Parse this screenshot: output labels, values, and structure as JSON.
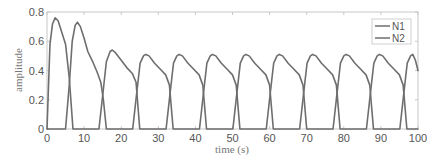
{
  "chart_data": {
    "type": "line",
    "title": "",
    "xlabel": "time (s)",
    "ylabel": "amplitude",
    "xlim": [
      0,
      100
    ],
    "ylim": [
      0,
      0.8
    ],
    "xticks": [
      0,
      10,
      20,
      30,
      40,
      50,
      60,
      70,
      80,
      90,
      100
    ],
    "xtick_labels": [
      "0",
      "10",
      "20",
      "30",
      "40",
      "50",
      "60",
      "70",
      "80",
      "90",
      "100"
    ],
    "yticks": [
      0,
      0.2,
      0.4,
      0.6,
      0.8
    ],
    "ytick_labels": [
      "0",
      "0.2",
      "0.4",
      "0.6",
      "0.8"
    ],
    "grid": false,
    "legend_position": "upper right",
    "line_color": "#6e6e6e",
    "series": [
      {
        "name": "N1",
        "points": [
          [
            0,
            0
          ],
          [
            0.8,
            0.58
          ],
          [
            1.5,
            0.72
          ],
          [
            2.2,
            0.76
          ],
          [
            3,
            0.74
          ],
          [
            4,
            0.66
          ],
          [
            5,
            0.58
          ],
          [
            6,
            0.35
          ],
          [
            7,
            0
          ],
          [
            7.1,
            0
          ],
          [
            14,
            0
          ],
          [
            15.1,
            0.25
          ],
          [
            16,
            0.46
          ],
          [
            17,
            0.53
          ],
          [
            17.6,
            0.54
          ],
          [
            18.5,
            0.52
          ],
          [
            20,
            0.47
          ],
          [
            21.5,
            0.42
          ],
          [
            23,
            0.38
          ],
          [
            24,
            0.32
          ],
          [
            25,
            0
          ],
          [
            25.1,
            0
          ],
          [
            32.1,
            0
          ],
          [
            33.2,
            0.25
          ],
          [
            34.1,
            0.45
          ],
          [
            35,
            0.5
          ],
          [
            35.6,
            0.51
          ],
          [
            36.5,
            0.5
          ],
          [
            38,
            0.45
          ],
          [
            39.5,
            0.41
          ],
          [
            41,
            0.37
          ],
          [
            42,
            0.3
          ],
          [
            43,
            0
          ],
          [
            43.1,
            0
          ],
          [
            50.1,
            0
          ],
          [
            51.2,
            0.25
          ],
          [
            52.1,
            0.45
          ],
          [
            53,
            0.5
          ],
          [
            53.6,
            0.51
          ],
          [
            54.5,
            0.5
          ],
          [
            56,
            0.45
          ],
          [
            57.5,
            0.41
          ],
          [
            59,
            0.37
          ],
          [
            60,
            0.3
          ],
          [
            61,
            0
          ],
          [
            61.1,
            0
          ],
          [
            68.1,
            0
          ],
          [
            69.2,
            0.25
          ],
          [
            70.1,
            0.45
          ],
          [
            71,
            0.5
          ],
          [
            71.6,
            0.51
          ],
          [
            72.5,
            0.5
          ],
          [
            74,
            0.45
          ],
          [
            75.5,
            0.41
          ],
          [
            77,
            0.37
          ],
          [
            78,
            0.3
          ],
          [
            79,
            0
          ],
          [
            79.1,
            0
          ],
          [
            86.1,
            0
          ],
          [
            87.2,
            0.25
          ],
          [
            88.1,
            0.45
          ],
          [
            89,
            0.5
          ],
          [
            89.6,
            0.51
          ],
          [
            90.5,
            0.5
          ],
          [
            92,
            0.45
          ],
          [
            93.5,
            0.41
          ],
          [
            95,
            0.37
          ],
          [
            96,
            0.3
          ],
          [
            97,
            0
          ],
          [
            100,
            0
          ]
        ]
      },
      {
        "name": "N2",
        "points": [
          [
            0,
            0
          ],
          [
            5,
            0
          ],
          [
            6,
            0.3
          ],
          [
            6.8,
            0.6
          ],
          [
            7.6,
            0.71
          ],
          [
            8.2,
            0.73
          ],
          [
            9,
            0.7
          ],
          [
            10,
            0.62
          ],
          [
            11,
            0.53
          ],
          [
            12.5,
            0.45
          ],
          [
            13.5,
            0.39
          ],
          [
            14.5,
            0.32
          ],
          [
            15.2,
            0.2
          ],
          [
            16,
            0
          ],
          [
            16.1,
            0
          ],
          [
            23.1,
            0
          ],
          [
            24.2,
            0.25
          ],
          [
            25.1,
            0.45
          ],
          [
            26,
            0.5
          ],
          [
            26.6,
            0.51
          ],
          [
            27.5,
            0.5
          ],
          [
            29,
            0.45
          ],
          [
            30.5,
            0.41
          ],
          [
            32,
            0.37
          ],
          [
            33,
            0.3
          ],
          [
            34,
            0
          ],
          [
            34.1,
            0
          ],
          [
            41.1,
            0
          ],
          [
            42.2,
            0.25
          ],
          [
            43.1,
            0.45
          ],
          [
            44,
            0.5
          ],
          [
            44.6,
            0.51
          ],
          [
            45.5,
            0.5
          ],
          [
            47,
            0.45
          ],
          [
            48.5,
            0.41
          ],
          [
            50,
            0.37
          ],
          [
            51,
            0.3
          ],
          [
            52,
            0
          ],
          [
            52.1,
            0
          ],
          [
            59.1,
            0
          ],
          [
            60.2,
            0.25
          ],
          [
            61.1,
            0.45
          ],
          [
            62,
            0.5
          ],
          [
            62.6,
            0.51
          ],
          [
            63.5,
            0.5
          ],
          [
            65,
            0.45
          ],
          [
            66.5,
            0.41
          ],
          [
            68,
            0.37
          ],
          [
            69,
            0.3
          ],
          [
            70,
            0
          ],
          [
            70.1,
            0
          ],
          [
            77.1,
            0
          ],
          [
            78.2,
            0.25
          ],
          [
            79.1,
            0.45
          ],
          [
            80,
            0.5
          ],
          [
            80.6,
            0.51
          ],
          [
            81.5,
            0.5
          ],
          [
            83,
            0.45
          ],
          [
            84.5,
            0.41
          ],
          [
            86,
            0.37
          ],
          [
            87,
            0.3
          ],
          [
            88,
            0
          ],
          [
            88.1,
            0
          ],
          [
            95.1,
            0
          ],
          [
            96.2,
            0.25
          ],
          [
            97.1,
            0.45
          ],
          [
            98,
            0.5
          ],
          [
            98.6,
            0.51
          ],
          [
            99.3,
            0.47
          ],
          [
            100,
            0.4
          ]
        ]
      }
    ]
  }
}
